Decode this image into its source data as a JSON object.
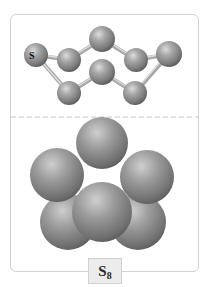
{
  "figure": {
    "molecule_formula": {
      "element": "S",
      "subscript": "8"
    },
    "ball_and_stick": {
      "atom_label": "S",
      "atoms": [
        {
          "id": 1,
          "cx": 36,
          "cy": 55,
          "r": 12
        },
        {
          "id": 2,
          "cx": 69,
          "cy": 60,
          "r": 12
        },
        {
          "id": 3,
          "cx": 102,
          "cy": 39,
          "r": 13
        },
        {
          "id": 4,
          "cx": 136,
          "cy": 60,
          "r": 12
        },
        {
          "id": 5,
          "cx": 169,
          "cy": 54,
          "r": 13
        },
        {
          "id": 6,
          "cx": 135,
          "cy": 93,
          "r": 12
        },
        {
          "id": 7,
          "cx": 102,
          "cy": 72,
          "r": 13
        },
        {
          "id": 8,
          "cx": 69,
          "cy": 93,
          "r": 12
        }
      ]
    },
    "space_filling": {
      "spheres": [
        {
          "cx": 68,
          "cy": 222,
          "r": 28
        },
        {
          "cx": 138,
          "cy": 222,
          "r": 28
        },
        {
          "cx": 57,
          "cy": 175,
          "r": 27
        },
        {
          "cx": 147,
          "cy": 177,
          "r": 27
        },
        {
          "cx": 102,
          "cy": 143,
          "r": 26
        },
        {
          "cx": 102,
          "cy": 212,
          "r": 30
        }
      ]
    },
    "colors": {
      "atom": "#8c8c8c",
      "atom_highlight": "#d8d8d8",
      "atom_shadow": "#5a5a5a",
      "bond": "#b8b8b8",
      "frame_border": "#d2d2d2",
      "divider": "#c8c8c8"
    }
  }
}
